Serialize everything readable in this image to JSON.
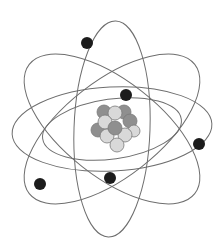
{
  "diagram": {
    "colors": {
      "background": "#ffffff",
      "orbit": "#6e6e6e",
      "electron": "#1c1c1c",
      "proton": "#8f8f8f",
      "neutron": "#d9d9d9",
      "particle_stroke": "#7a7a7a"
    },
    "orbits": [
      {
        "cx": 112,
        "cy": 129,
        "rx": 38,
        "ry": 108,
        "rotate": 2
      },
      {
        "cx": 112,
        "cy": 129,
        "rx": 100,
        "ry": 42,
        "rotate": -3
      },
      {
        "cx": 112,
        "cy": 129,
        "rx": 70,
        "ry": 30,
        "rotate": -8
      },
      {
        "cx": 112,
        "cy": 129,
        "rx": 105,
        "ry": 48,
        "rotate": 38
      },
      {
        "cx": 112,
        "cy": 129,
        "rx": 105,
        "ry": 48,
        "rotate": -38
      }
    ],
    "electrons": [
      {
        "cx": 87,
        "cy": 43,
        "r": 6
      },
      {
        "cx": 126,
        "cy": 95,
        "r": 6
      },
      {
        "cx": 199,
        "cy": 144,
        "r": 6
      },
      {
        "cx": 40,
        "cy": 184,
        "r": 6
      },
      {
        "cx": 110,
        "cy": 178,
        "r": 6
      }
    ],
    "nucleus": [
      {
        "cx": 104,
        "cy": 112,
        "r": 7,
        "type": "proton"
      },
      {
        "cx": 124,
        "cy": 112,
        "r": 7,
        "type": "proton"
      },
      {
        "cx": 115,
        "cy": 113,
        "r": 7,
        "type": "neutron"
      },
      {
        "cx": 98,
        "cy": 130,
        "r": 7,
        "type": "proton"
      },
      {
        "cx": 130,
        "cy": 121,
        "r": 7,
        "type": "proton"
      },
      {
        "cx": 105,
        "cy": 122,
        "r": 7,
        "type": "neutron"
      },
      {
        "cx": 134,
        "cy": 131,
        "r": 6,
        "type": "neutron"
      },
      {
        "cx": 107,
        "cy": 136,
        "r": 7,
        "type": "neutron"
      },
      {
        "cx": 125,
        "cy": 135,
        "r": 7,
        "type": "neutron"
      },
      {
        "cx": 115,
        "cy": 128,
        "r": 7,
        "type": "proton"
      },
      {
        "cx": 117,
        "cy": 145,
        "r": 7,
        "type": "neutron"
      }
    ]
  }
}
